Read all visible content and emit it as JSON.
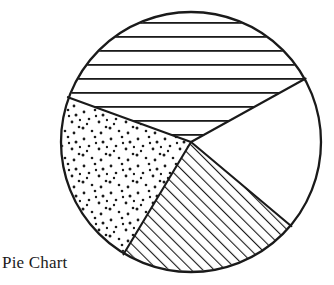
{
  "figure": {
    "caption": "Pie Chart",
    "background_color": "#ffffff",
    "stroke_color": "#1a1a1a"
  },
  "chart_data": {
    "type": "pie",
    "title": "Pie Chart",
    "subtitle": "",
    "xlabel": "",
    "ylabel": "",
    "grid": false,
    "legend_position": "none",
    "center_px": [
      191,
      142
    ],
    "radius_px": 130,
    "start_angle_deg": 29,
    "direction": "counterclockwise",
    "total_degrees": 360,
    "slices": [
      {
        "name": "slice-horizontal-lines",
        "label": "",
        "value": 131,
        "percent": 36.4,
        "start_angle_deg": 29,
        "end_angle_deg": 160,
        "fill_pattern": "horizontal-lines",
        "fill_color": "#ffffff",
        "pattern_color": "#1a1a1a",
        "pattern_spacing_px": 14,
        "pattern_width_px": 1.8
      },
      {
        "name": "slice-dots",
        "label": "",
        "value": 79,
        "percent": 21.9,
        "start_angle_deg": 160,
        "end_angle_deg": 239,
        "fill_pattern": "dots",
        "fill_color": "#ffffff",
        "pattern_color": "#1a1a1a",
        "pattern_spacing_px": 9,
        "dot_radius_px": 1.4
      },
      {
        "name": "slice-diagonal-hatch",
        "label": "",
        "value": 81,
        "percent": 22.5,
        "start_angle_deg": 239,
        "end_angle_deg": 320,
        "fill_pattern": "diagonal-lines",
        "fill_color": "#ffffff",
        "pattern_color": "#1a1a1a",
        "pattern_spacing_px": 8,
        "pattern_width_px": 2.2,
        "pattern_angle_deg": 45
      },
      {
        "name": "slice-blank",
        "label": "",
        "value": 69,
        "percent": 19.2,
        "start_angle_deg": 320,
        "end_angle_deg": 389,
        "fill_pattern": "none",
        "fill_color": "#ffffff",
        "pattern_color": "#1a1a1a"
      }
    ]
  }
}
